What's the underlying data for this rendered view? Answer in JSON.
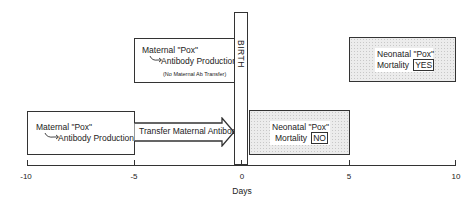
{
  "diagram": {
    "type": "timeline",
    "axis": {
      "label": "Days",
      "ticks": [
        "-10",
        "-5",
        "0",
        "5",
        "10"
      ],
      "range": [
        -10,
        10
      ]
    },
    "birth_marker": {
      "label": "BIRTH",
      "day": 0
    },
    "boxes": [
      {
        "id": "maternal-prenatal",
        "line1": "Maternal \"Pox\"",
        "line2": "Antibody Production",
        "span_days": [
          -10,
          -5
        ]
      },
      {
        "id": "transfer-arrow",
        "label": "Transfer Maternal Antibody",
        "span_days": [
          -5,
          0
        ]
      },
      {
        "id": "maternal-no-transfer",
        "line1": "Maternal \"Pox\"",
        "line2": "Antibody Production",
        "note": "(No Maternal Ab Transfer)",
        "span_days": [
          -5,
          0
        ]
      },
      {
        "id": "neonatal-no",
        "line1": "Neonatal \"Pox\"",
        "line2": "Mortality",
        "tag": "NO",
        "span_days": [
          0,
          5
        ]
      },
      {
        "id": "neonatal-yes",
        "line1": "Neonatal \"Pox\"",
        "line2": "Mortality",
        "tag": "YES",
        "span_days": [
          5,
          10
        ]
      }
    ]
  }
}
